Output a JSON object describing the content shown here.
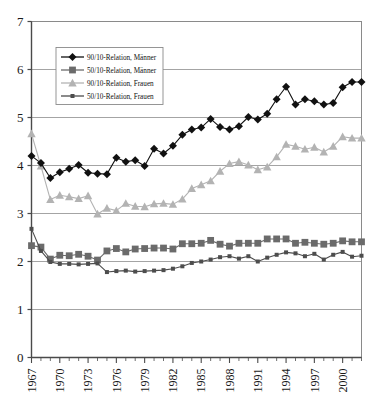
{
  "chart_data": {
    "type": "line",
    "title": "",
    "subtitle": "",
    "xlabel": "",
    "ylabel": "",
    "grid": true,
    "grid_axis": "y",
    "legend_position": "upper-left-inside",
    "xlim": [
      1967,
      2002
    ],
    "ylim": [
      0,
      7
    ],
    "ytick_step": 1,
    "yticks": [
      "0",
      "1",
      "2",
      "3",
      "4",
      "5",
      "6",
      "7"
    ],
    "x": [
      1967,
      1968,
      1969,
      1970,
      1971,
      1972,
      1973,
      1974,
      1975,
      1976,
      1977,
      1978,
      1979,
      1980,
      1981,
      1982,
      1983,
      1984,
      1985,
      1986,
      1987,
      1988,
      1989,
      1990,
      1991,
      1992,
      1993,
      1994,
      1995,
      1996,
      1997,
      1998,
      1999,
      2000,
      2001,
      2002
    ],
    "xticklabels": [
      "1967",
      "1970",
      "1973",
      "1976",
      "1979",
      "1982",
      "1985",
      "1988",
      "1991",
      "1994",
      "1997",
      "2000"
    ],
    "xticklabel_years": [
      1967,
      1970,
      1973,
      1976,
      1979,
      1982,
      1985,
      1988,
      1991,
      1994,
      1997,
      2000
    ],
    "xtick_interval": 3,
    "xtick_minor_interval": 1,
    "series": [
      {
        "name": "90/10-Relation, Männer",
        "marker": "diamond",
        "color": "#111111",
        "line_color": "#111111",
        "values": [
          4.2,
          4.05,
          3.74,
          3.86,
          3.93,
          4.01,
          3.85,
          3.83,
          3.82,
          4.16,
          4.08,
          4.11,
          3.99,
          4.35,
          4.25,
          4.41,
          4.64,
          4.75,
          4.79,
          4.97,
          4.8,
          4.75,
          4.82,
          5.01,
          4.96,
          5.08,
          5.38,
          5.64,
          5.27,
          5.38,
          5.34,
          5.27,
          5.3,
          5.63,
          5.74,
          5.74
        ]
      },
      {
        "name": "50/10-Relation, Männer",
        "marker": "square",
        "color": "#6b6b6b",
        "line_color": "#6b6b6b",
        "values": [
          2.33,
          2.3,
          2.05,
          2.13,
          2.12,
          2.15,
          2.11,
          2.03,
          2.22,
          2.27,
          2.2,
          2.26,
          2.27,
          2.28,
          2.28,
          2.26,
          2.37,
          2.37,
          2.38,
          2.44,
          2.36,
          2.32,
          2.38,
          2.38,
          2.38,
          2.47,
          2.47,
          2.47,
          2.38,
          2.4,
          2.38,
          2.36,
          2.38,
          2.43,
          2.41,
          2.41
        ]
      },
      {
        "name": "90/10-Relation, Frauen",
        "marker": "triangle",
        "color": "#b3b3b3",
        "line_color": "#b3b3b3",
        "values": [
          4.66,
          3.99,
          3.29,
          3.38,
          3.35,
          3.31,
          3.37,
          2.99,
          3.11,
          3.06,
          3.21,
          3.15,
          3.14,
          3.2,
          3.21,
          3.19,
          3.3,
          3.52,
          3.6,
          3.68,
          3.88,
          4.04,
          4.08,
          4.01,
          3.91,
          3.97,
          4.18,
          4.44,
          4.4,
          4.34,
          4.38,
          4.28,
          4.4,
          4.6,
          4.57,
          4.57
        ]
      },
      {
        "name": "50/10-Relation, Frauen",
        "marker": "small-square",
        "color": "#4d4d4d",
        "line_color": "#4d4d4d",
        "values": [
          2.68,
          2.22,
          1.99,
          1.95,
          1.95,
          1.94,
          1.95,
          1.96,
          1.78,
          1.8,
          1.81,
          1.79,
          1.8,
          1.81,
          1.82,
          1.85,
          1.9,
          1.97,
          2.0,
          2.04,
          2.09,
          2.11,
          2.06,
          2.11,
          2.0,
          2.08,
          2.14,
          2.19,
          2.17,
          2.11,
          2.16,
          2.04,
          2.14,
          2.2,
          2.1,
          2.12
        ]
      }
    ],
    "legend_entries": [
      "90/10-Relation, Männer",
      "50/10-Relation, Männer",
      "90/10-Relation, Frauen",
      "50/10-Relation, Frauen"
    ],
    "colors": {
      "maenner_9010": "#111111",
      "maenner_5010": "#6b6b6b",
      "frauen_9010": "#b3b3b3",
      "frauen_5010": "#4d4d4d",
      "gridline": "#9a9a9a",
      "axis": "#4a4a4a",
      "plot_border": "#8a8a8a",
      "background": "#ffffff",
      "text": "#1a1a1a"
    }
  }
}
